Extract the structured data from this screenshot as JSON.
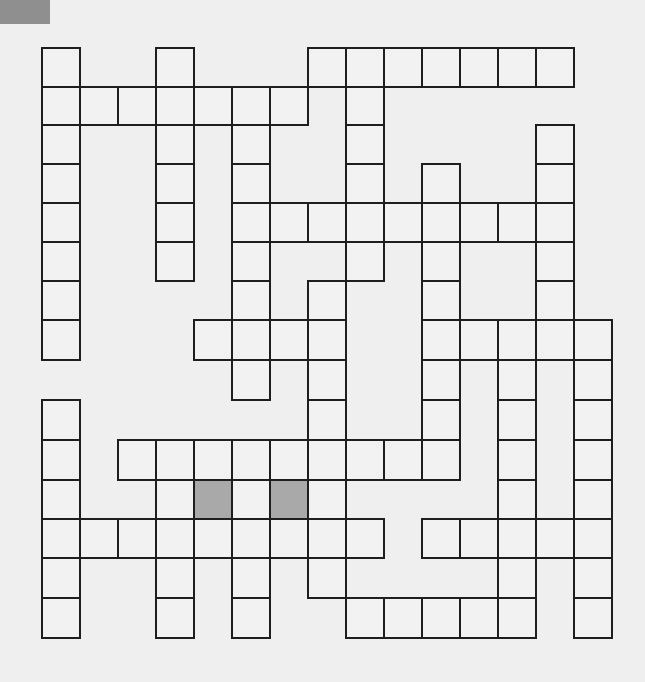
{
  "puzzle": {
    "type": "crossword",
    "rows": 15,
    "cols": 15,
    "colors": {
      "background": "#efefef",
      "cell_fill": "#f2f2f2",
      "cell_border": "#1e1e1e",
      "shaded_fill": "#a9a9a9",
      "corner_mark": "#8f8f8f"
    },
    "cells_by_row": [
      {
        "row": 0,
        "cols": [
          0,
          3,
          7,
          8,
          9,
          10,
          11,
          12,
          13
        ]
      },
      {
        "row": 1,
        "cols": [
          0,
          1,
          2,
          3,
          4,
          5,
          6,
          8
        ]
      },
      {
        "row": 2,
        "cols": [
          0,
          3,
          5,
          8,
          13
        ]
      },
      {
        "row": 3,
        "cols": [
          0,
          3,
          5,
          8,
          10,
          13
        ]
      },
      {
        "row": 4,
        "cols": [
          0,
          3,
          5,
          6,
          7,
          8,
          9,
          10,
          11,
          12,
          13
        ]
      },
      {
        "row": 5,
        "cols": [
          0,
          3,
          5,
          8,
          10,
          13
        ]
      },
      {
        "row": 6,
        "cols": [
          0,
          5,
          7,
          10,
          13
        ]
      },
      {
        "row": 7,
        "cols": [
          0,
          4,
          5,
          6,
          7,
          10,
          11,
          12,
          13,
          14
        ]
      },
      {
        "row": 8,
        "cols": [
          5,
          7,
          10,
          12,
          14
        ]
      },
      {
        "row": 9,
        "cols": [
          0,
          7,
          10,
          12,
          14
        ]
      },
      {
        "row": 10,
        "cols": [
          0,
          2,
          3,
          4,
          5,
          6,
          7,
          8,
          9,
          10,
          12,
          14
        ]
      },
      {
        "row": 11,
        "cols": [
          0,
          3,
          4,
          5,
          6,
          7,
          12,
          14
        ]
      },
      {
        "row": 12,
        "cols": [
          0,
          1,
          2,
          3,
          4,
          5,
          6,
          7,
          8,
          10,
          11,
          12,
          13,
          14
        ]
      },
      {
        "row": 13,
        "cols": [
          0,
          3,
          5,
          7,
          12,
          14
        ]
      },
      {
        "row": 14,
        "cols": [
          0,
          3,
          5,
          8,
          9,
          10,
          11,
          12,
          14
        ]
      }
    ],
    "shaded_cells": [
      {
        "row": 11,
        "col": 4
      },
      {
        "row": 11,
        "col": 6
      }
    ],
    "entries": {}
  }
}
